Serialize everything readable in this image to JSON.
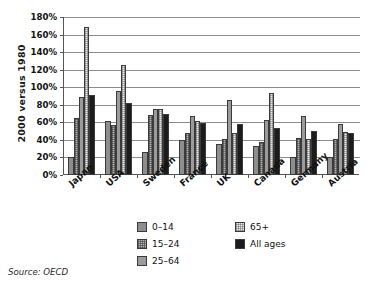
{
  "chart_data": {
    "type": "bar",
    "title": "",
    "xlabel": "",
    "ylabel": "2000 versus 1980",
    "ylim": [
      0,
      180
    ],
    "ytick_step": 20,
    "ytick_labels": [
      "0%",
      "20%",
      "40%",
      "60%",
      "80%",
      "100%",
      "120%",
      "140%",
      "160%",
      "180%"
    ],
    "grid": true,
    "legend_position": "bottom",
    "categories": [
      "Japan",
      "USA",
      "Sweden",
      "France",
      "UK",
      "Canada",
      "Germany",
      "Austria"
    ],
    "series": [
      {
        "name": "0–14",
        "color": "#8e8e8e",
        "pattern": "solid-mid-gray",
        "values": [
          20,
          62,
          26,
          40,
          35,
          33,
          20,
          20
        ]
      },
      {
        "name": "15–24",
        "color": "#b4b4b4",
        "pattern": "checker-dark",
        "values": [
          65,
          57,
          68,
          48,
          41,
          38,
          42,
          41
        ]
      },
      {
        "name": "25–64",
        "color": "#9b9b9b",
        "pattern": "solid-gray",
        "values": [
          89,
          96,
          75,
          67,
          85,
          63,
          67,
          58
        ]
      },
      {
        "name": "65+",
        "color": "#ececec",
        "pattern": "checker-light",
        "values": [
          169,
          125,
          75,
          62,
          48,
          93,
          41,
          49
        ]
      },
      {
        "name": "All ages",
        "color": "#1c1c1c",
        "pattern": "solid-black",
        "values": [
          91,
          82,
          69,
          59,
          58,
          53,
          50,
          48
        ]
      }
    ],
    "annotations": {
      "source": "Source: OECD"
    }
  },
  "legend": {
    "entries": [
      {
        "label": "0–14"
      },
      {
        "label": "15–24"
      },
      {
        "label": "25–64"
      },
      {
        "label": "65+"
      },
      {
        "label": "All ages"
      }
    ]
  },
  "axis": {
    "y_title": "2000 versus 1980"
  },
  "footer": {
    "source": "Source: OECD"
  }
}
